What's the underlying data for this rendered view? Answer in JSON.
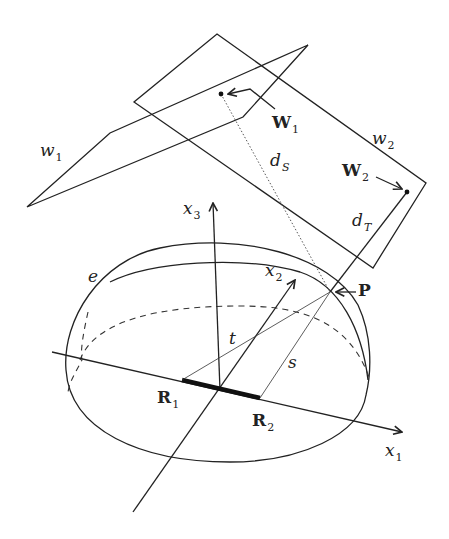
{
  "figure": {
    "labels": {
      "w1": {
        "base": "w",
        "sub": "1"
      },
      "w2": {
        "base": "w",
        "sub": "2"
      },
      "W1": {
        "base": "W",
        "sub": "1"
      },
      "W2": {
        "base": "W",
        "sub": "2"
      },
      "dS": {
        "base": "d",
        "sub": "S"
      },
      "dT": {
        "base": "d",
        "sub": "T"
      },
      "x1": {
        "base": "x",
        "sub": "1"
      },
      "x2": {
        "base": "x",
        "sub": "2"
      },
      "x3": {
        "base": "x",
        "sub": "3"
      },
      "P": "P",
      "R1": {
        "base": "R",
        "sub": "1"
      },
      "R2": {
        "base": "R",
        "sub": "2"
      },
      "e": "e",
      "t": "t",
      "s": "s"
    },
    "colors": {
      "stroke": "#222222",
      "background": "#ffffff"
    }
  }
}
